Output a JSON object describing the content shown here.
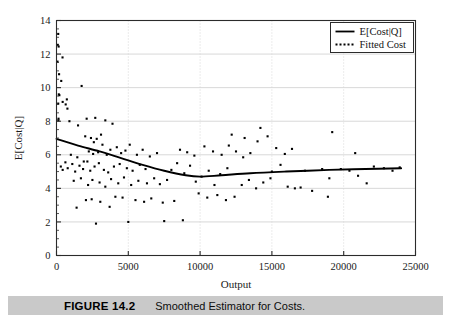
{
  "figure": {
    "caption_label": "FIGURE 14.2",
    "caption_text": "Smoothed Estimator for Costs.",
    "caption_bar_color": "#c9c9c9"
  },
  "legend": {
    "position": "top-right",
    "entries": [
      {
        "label": "E[Cost|Q]",
        "style": "solid-line",
        "color": "#000000"
      },
      {
        "label": "Fitted Cost",
        "style": "dotted-line",
        "color": "#000000"
      }
    ]
  },
  "axes": {
    "x_label": "Output",
    "y_label": "E[Cost|Q]",
    "x_ticks": [
      "0",
      "5000",
      "10000",
      "15000",
      "20000",
      "25000"
    ],
    "y_ticks": [
      "0",
      "2",
      "4",
      "6",
      "8",
      "10",
      "12",
      "14"
    ],
    "grid": true,
    "grid_color": "#d8d8d8",
    "frame_color": "#2b2b2b"
  },
  "chart_data": {
    "type": "scatter",
    "title": "Smoothed Estimator for Costs.",
    "xlabel": "Output",
    "ylabel": "E[Cost|Q]",
    "xlim": [
      0,
      25000
    ],
    "ylim": [
      0,
      14
    ],
    "xticks": [
      0,
      5000,
      10000,
      15000,
      20000,
      25000
    ],
    "yticks": [
      0,
      2,
      4,
      6,
      8,
      10,
      12,
      14
    ],
    "grid": true,
    "legend_position": "upper right",
    "series": [
      {
        "name": "Scatter (observed cost)",
        "type": "scatter",
        "marker": "square",
        "marker_size": 2.1,
        "color": "#000000",
        "points": [
          [
            120,
            13.2
          ],
          [
            90,
            12.55
          ],
          [
            150,
            12.45
          ],
          [
            420,
            11.8
          ],
          [
            70,
            11.55
          ],
          [
            180,
            10.8
          ],
          [
            330,
            10.4
          ],
          [
            1750,
            10.1
          ],
          [
            160,
            9.6
          ],
          [
            200,
            9.55
          ],
          [
            120,
            9.05
          ],
          [
            430,
            9.15
          ],
          [
            640,
            9.0
          ],
          [
            720,
            9.3
          ],
          [
            760,
            8.75
          ],
          [
            140,
            8.15
          ],
          [
            130,
            8.05
          ],
          [
            900,
            8.0
          ],
          [
            2100,
            8.15
          ],
          [
            2700,
            8.2
          ],
          [
            1500,
            7.75
          ],
          [
            3400,
            8.05
          ],
          [
            3900,
            7.85
          ],
          [
            2000,
            7.1
          ],
          [
            2400,
            7.0
          ],
          [
            2800,
            6.95
          ],
          [
            3100,
            7.2
          ],
          [
            2600,
            6.75
          ],
          [
            3200,
            6.6
          ],
          [
            1000,
            6.0
          ],
          [
            1450,
            5.85
          ],
          [
            1900,
            5.6
          ],
          [
            2250,
            6.2
          ],
          [
            2550,
            6.05
          ],
          [
            2900,
            6.15
          ],
          [
            3500,
            6.0
          ],
          [
            3750,
            6.3
          ],
          [
            4200,
            6.45
          ],
          [
            4500,
            6.1
          ],
          [
            4800,
            6.25
          ],
          [
            300,
            5.3
          ],
          [
            430,
            5.1
          ],
          [
            620,
            5.55
          ],
          [
            780,
            5.2
          ],
          [
            1100,
            5.45
          ],
          [
            1300,
            5.0
          ],
          [
            1600,
            5.35
          ],
          [
            1850,
            5.15
          ],
          [
            2150,
            5.6
          ],
          [
            2350,
            5.05
          ],
          [
            2650,
            5.3
          ],
          [
            2950,
            5.5
          ],
          [
            3300,
            5.1
          ],
          [
            3600,
            4.95
          ],
          [
            4000,
            5.3
          ],
          [
            4400,
            5.45
          ],
          [
            4900,
            5.2
          ],
          [
            5300,
            5.05
          ],
          [
            5800,
            5.4
          ],
          [
            6200,
            5.15
          ],
          [
            5100,
            6.6
          ],
          [
            5600,
            6.0
          ],
          [
            6000,
            6.3
          ],
          [
            6500,
            5.9
          ],
          [
            7000,
            6.1
          ],
          [
            1200,
            4.45
          ],
          [
            1700,
            4.6
          ],
          [
            2200,
            4.2
          ],
          [
            2500,
            4.5
          ],
          [
            3000,
            4.35
          ],
          [
            3400,
            4.1
          ],
          [
            3800,
            4.55
          ],
          [
            4300,
            4.3
          ],
          [
            4700,
            4.65
          ],
          [
            5200,
            4.2
          ],
          [
            5700,
            4.45
          ],
          [
            6300,
            4.3
          ],
          [
            6800,
            4.6
          ],
          [
            7200,
            4.25
          ],
          [
            7700,
            4.5
          ],
          [
            2050,
            3.3
          ],
          [
            2450,
            3.35
          ],
          [
            3050,
            3.2
          ],
          [
            4100,
            3.5
          ],
          [
            4600,
            3.45
          ],
          [
            5500,
            3.3
          ],
          [
            6100,
            3.2
          ],
          [
            6600,
            3.4
          ],
          [
            7400,
            3.15
          ],
          [
            8200,
            3.25
          ],
          [
            1400,
            2.85
          ],
          [
            2750,
            1.9
          ],
          [
            5000,
            2.0
          ],
          [
            8800,
            2.1
          ],
          [
            8000,
            5.1
          ],
          [
            8400,
            5.5
          ],
          [
            8900,
            4.9
          ],
          [
            9300,
            5.35
          ],
          [
            9700,
            4.4
          ],
          [
            10100,
            4.7
          ],
          [
            10600,
            5.05
          ],
          [
            11000,
            4.2
          ],
          [
            11400,
            4.85
          ],
          [
            11900,
            5.2
          ],
          [
            8600,
            6.3
          ],
          [
            9100,
            6.15
          ],
          [
            9600,
            5.95
          ],
          [
            10300,
            6.5
          ],
          [
            10900,
            6.2
          ],
          [
            11500,
            6.0
          ],
          [
            12000,
            6.55
          ],
          [
            12500,
            6.2
          ],
          [
            13000,
            5.85
          ],
          [
            13500,
            6.1
          ],
          [
            9900,
            3.7
          ],
          [
            10500,
            3.45
          ],
          [
            11200,
            3.6
          ],
          [
            11800,
            3.3
          ],
          [
            12400,
            3.5
          ],
          [
            12900,
            4.2
          ],
          [
            13400,
            4.5
          ],
          [
            13900,
            4.0
          ],
          [
            14400,
            4.35
          ],
          [
            14900,
            4.6
          ],
          [
            12200,
            7.2
          ],
          [
            13100,
            7.0
          ],
          [
            14000,
            6.8
          ],
          [
            14700,
            7.1
          ],
          [
            15300,
            6.4
          ],
          [
            15000,
            5.0
          ],
          [
            15600,
            5.4
          ],
          [
            16100,
            4.1
          ],
          [
            16600,
            4.0
          ],
          [
            17000,
            4.05
          ],
          [
            15900,
            6.05
          ],
          [
            16400,
            6.35
          ],
          [
            17300,
            5.05
          ],
          [
            17800,
            3.85
          ],
          [
            14200,
            7.6
          ],
          [
            18500,
            5.15
          ],
          [
            19200,
            7.35
          ],
          [
            19000,
            4.6
          ],
          [
            19800,
            5.15
          ],
          [
            20400,
            5.05
          ],
          [
            21000,
            4.75
          ],
          [
            21600,
            4.3
          ],
          [
            22100,
            5.3
          ],
          [
            22800,
            5.2
          ],
          [
            23400,
            5.05
          ],
          [
            23900,
            5.25
          ],
          [
            20800,
            6.1
          ],
          [
            18900,
            3.5
          ],
          [
            7500,
            2.05
          ],
          [
            3700,
            2.9
          ]
        ]
      },
      {
        "name": "E[Cost|Q]",
        "type": "line",
        "style": "solid",
        "color": "#000000",
        "line_width": 1.9,
        "points": [
          [
            0,
            6.95
          ],
          [
            1500,
            6.55
          ],
          [
            3000,
            6.2
          ],
          [
            4500,
            5.8
          ],
          [
            6000,
            5.4
          ],
          [
            7500,
            5.05
          ],
          [
            9000,
            4.78
          ],
          [
            10000,
            4.7
          ],
          [
            11500,
            4.78
          ],
          [
            13500,
            4.9
          ],
          [
            16000,
            5.0
          ],
          [
            19000,
            5.1
          ],
          [
            21500,
            5.15
          ],
          [
            24000,
            5.2
          ]
        ]
      }
    ]
  }
}
